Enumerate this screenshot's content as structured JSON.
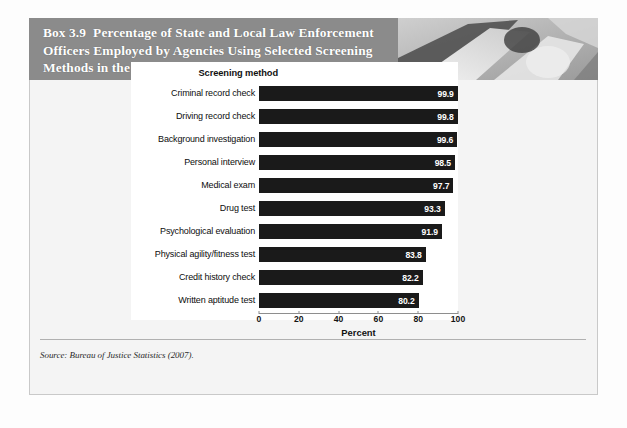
{
  "box": {
    "number": "Box 3.9",
    "title": "Percentage of State and Local Law Enforcement Officers Employed by Agencies Using Selected Screening Methods in the Hiring Process for Sworn Positions, 2007",
    "header_bg": "#8b8b8b",
    "header_text_color": "#ffffff",
    "photo_alt": "police-officer-photo"
  },
  "chart_data": {
    "type": "bar",
    "orientation": "horizontal",
    "title": "Percentage of State and Local Law Enforcement Officers Employed by Agencies Using Selected Screening Methods in the Hiring Process for Sworn Positions, 2007",
    "category_axis_title": "Screening method",
    "xlabel": "Percent",
    "ylabel": "",
    "xlim": [
      0,
      100
    ],
    "xticks": [
      0,
      20,
      40,
      60,
      80,
      100
    ],
    "grid": false,
    "legend": false,
    "bar_color": "#1a1a1a",
    "value_label_color": "#ffffff",
    "categories": [
      "Criminal record check",
      "Driving record check",
      "Background investigation",
      "Personal interview",
      "Medical exam",
      "Drug test",
      "Psychological evaluation",
      "Physical agility/fitness test",
      "Credit history check",
      "Written aptitude test"
    ],
    "values": [
      99.9,
      99.8,
      99.6,
      98.5,
      97.7,
      93.3,
      91.9,
      83.8,
      82.2,
      80.2
    ],
    "value_labels": [
      "99.9",
      "99.8",
      "99.6",
      "98.5",
      "97.7",
      "93.3",
      "91.9",
      "83.8",
      "82.2",
      "80.2"
    ]
  },
  "source": {
    "text": "Source: Bureau of Justice Statistics (2007)."
  }
}
